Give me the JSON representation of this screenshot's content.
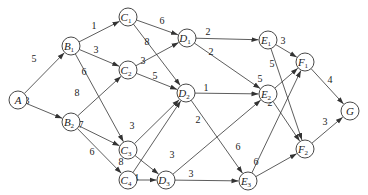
{
  "diagram": {
    "type": "weighted-directed-graph",
    "nodes": [
      {
        "id": "A",
        "label": "A",
        "sub": "",
        "x": 18,
        "y": 100
      },
      {
        "id": "B1",
        "label": "B",
        "sub": "1",
        "x": 71,
        "y": 46
      },
      {
        "id": "B2",
        "label": "B",
        "sub": "2",
        "x": 71,
        "y": 122
      },
      {
        "id": "C1",
        "label": "C",
        "sub": "1",
        "x": 128,
        "y": 17
      },
      {
        "id": "C2",
        "label": "C",
        "sub": "2",
        "x": 128,
        "y": 70
      },
      {
        "id": "C3",
        "label": "C",
        "sub": "3",
        "x": 128,
        "y": 150
      },
      {
        "id": "C4",
        "label": "C",
        "sub": "4",
        "x": 128,
        "y": 180
      },
      {
        "id": "D1",
        "label": "D",
        "sub": "1",
        "x": 187,
        "y": 38
      },
      {
        "id": "D2",
        "label": "D",
        "sub": "2",
        "x": 186,
        "y": 93
      },
      {
        "id": "D3",
        "label": "D",
        "sub": "3",
        "x": 166,
        "y": 180
      },
      {
        "id": "E1",
        "label": "E",
        "sub": "1",
        "x": 268,
        "y": 40
      },
      {
        "id": "E2",
        "label": "E",
        "sub": "2",
        "x": 268,
        "y": 94
      },
      {
        "id": "E3",
        "label": "E",
        "sub": "3",
        "x": 248,
        "y": 181
      },
      {
        "id": "F1",
        "label": "F",
        "sub": "1",
        "x": 305,
        "y": 62
      },
      {
        "id": "F2",
        "label": "F",
        "sub": "2",
        "x": 305,
        "y": 149
      },
      {
        "id": "G",
        "label": "G",
        "sub": "",
        "x": 350,
        "y": 111
      }
    ],
    "edges": [
      {
        "from": "A",
        "to": "B1",
        "weight": "5",
        "lx": 34,
        "ly": 62
      },
      {
        "from": "A",
        "to": "B2",
        "weight": "3",
        "lx": 27,
        "ly": 104
      },
      {
        "from": "B1",
        "to": "C1",
        "weight": "1",
        "lx": 94,
        "ly": 29
      },
      {
        "from": "B1",
        "to": "C2",
        "weight": "3",
        "lx": 96,
        "ly": 53
      },
      {
        "from": "B1",
        "to": "C3",
        "weight": "6",
        "lx": 84,
        "ly": 75
      },
      {
        "from": "B2",
        "to": "C2",
        "weight": "8",
        "lx": 77,
        "ly": 96
      },
      {
        "from": "B2",
        "to": "C3",
        "weight": "7",
        "lx": 81,
        "ly": 128
      },
      {
        "from": "B2",
        "to": "C4",
        "weight": "6",
        "lx": 92,
        "ly": 155
      },
      {
        "from": "C1",
        "to": "D1",
        "weight": "6",
        "lx": 162,
        "ly": 24
      },
      {
        "from": "C1",
        "to": "D2",
        "weight": "8",
        "lx": 147,
        "ly": 45
      },
      {
        "from": "C2",
        "to": "D1",
        "weight": "3",
        "lx": 143,
        "ly": 64
      },
      {
        "from": "C2",
        "to": "D2",
        "weight": "5",
        "lx": 155,
        "ly": 79
      },
      {
        "from": "C3",
        "to": "D2",
        "weight": "3",
        "lx": 132,
        "ly": 129
      },
      {
        "from": "C3",
        "to": "D3",
        "weight": "3",
        "lx": 131,
        "ly": 149
      },
      {
        "from": "C4",
        "to": "D2",
        "weight": "8",
        "lx": 121,
        "ly": 165
      },
      {
        "from": "C4",
        "to": "D3",
        "weight": "4",
        "lx": 136,
        "ly": 181
      },
      {
        "from": "D1",
        "to": "E1",
        "weight": "2",
        "lx": 208,
        "ly": 35
      },
      {
        "from": "D1",
        "to": "E2",
        "weight": "2",
        "lx": 211,
        "ly": 55
      },
      {
        "from": "D2",
        "to": "E2",
        "weight": "1",
        "lx": 206,
        "ly": 91
      },
      {
        "from": "D2",
        "to": "E3",
        "weight": "2",
        "lx": 198,
        "ly": 123
      },
      {
        "from": "D3",
        "to": "E2",
        "weight": "3",
        "lx": 172,
        "ly": 158
      },
      {
        "from": "D3",
        "to": "E3",
        "weight": "3",
        "lx": 191,
        "ly": 177
      },
      {
        "from": "E1",
        "to": "F1",
        "weight": "3",
        "lx": 283,
        "ly": 44
      },
      {
        "from": "E1",
        "to": "F2",
        "weight": "5",
        "lx": 272,
        "ly": 67
      },
      {
        "from": "E2",
        "to": "F1",
        "weight": "5",
        "lx": 260,
        "ly": 82
      },
      {
        "from": "E2",
        "to": "F2",
        "weight": "2",
        "lx": 270,
        "ly": 106
      },
      {
        "from": "E3",
        "to": "F1",
        "weight": "6",
        "lx": 238,
        "ly": 150
      },
      {
        "from": "E3",
        "to": "F2",
        "weight": "6",
        "lx": 256,
        "ly": 165
      },
      {
        "from": "F1",
        "to": "G",
        "weight": "4",
        "lx": 330,
        "ly": 83
      },
      {
        "from": "F2",
        "to": "G",
        "weight": "3",
        "lx": 325,
        "ly": 125
      }
    ],
    "node_radius": 9
  }
}
